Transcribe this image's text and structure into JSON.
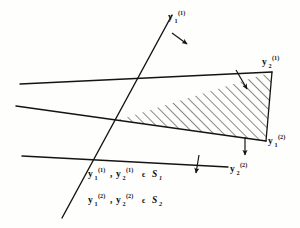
{
  "figure": {
    "background_color": "#fefefd",
    "ink_color": "#141414",
    "labels": {
      "y1_1": {
        "base": "y",
        "sub": "1",
        "sup": "(1)"
      },
      "y2_1": {
        "base": "y",
        "sub": "2",
        "sup": "(1)"
      },
      "y1_2": {
        "base": "y",
        "sub": "1",
        "sup": "(2)"
      },
      "y2_2": {
        "base": "y",
        "sub": "2",
        "sup": "(2)"
      }
    },
    "legend": {
      "line1": {
        "first_base": "y",
        "first_sub": "1",
        "first_sup": "(1)",
        "comma": ",",
        "second_base": "y",
        "second_sub": "2",
        "second_sup": "(1)",
        "member": "ϵ",
        "set_base": "S",
        "set_sub": "1"
      },
      "line2": {
        "first_base": "y",
        "first_sub": "1",
        "first_sup": "(2)",
        "comma": ",",
        "second_base": "y",
        "second_sub": "2",
        "second_sup": "(2)",
        "member": "ϵ",
        "set_base": "S",
        "set_sub": "2"
      }
    },
    "geometry": {
      "vertex": [
        118,
        120
      ],
      "hatched_region_label": "feasible-cone",
      "hatch_angle_deg": 45,
      "lines": [
        {
          "name": "y1-1-line",
          "from": [
            62,
            218
          ],
          "to": [
            172,
            15
          ]
        },
        {
          "name": "y2-1-line",
          "from": [
            20,
            84
          ],
          "to": [
            272,
            72
          ]
        },
        {
          "name": "y1-2-line",
          "from": [
            16,
            106
          ],
          "to": [
            266,
            141
          ]
        },
        {
          "name": "y2-2-line",
          "from": [
            22,
            156
          ],
          "to": [
            228,
            167
          ]
        }
      ],
      "normal_arrows": [
        {
          "name": "arrow-y1-1",
          "from": [
            172,
            33
          ],
          "to": [
            186,
            43
          ]
        },
        {
          "name": "arrow-y2-1",
          "from": [
            236,
            70
          ],
          "to": [
            247,
            88
          ]
        },
        {
          "name": "arrow-y1-2",
          "from": [
            245,
            137
          ],
          "to": [
            245,
            154
          ]
        },
        {
          "name": "arrow-y2-2",
          "from": [
            199,
            155
          ],
          "to": [
            196,
            172
          ]
        }
      ]
    }
  }
}
